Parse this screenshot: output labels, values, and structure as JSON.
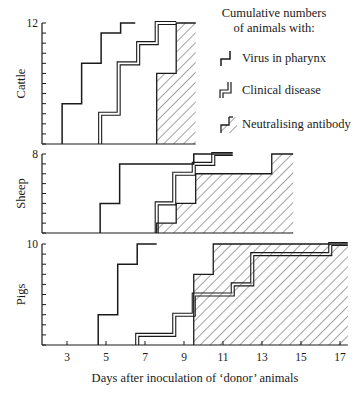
{
  "chart_data": {
    "type": "line",
    "subtype": "cumulative-step",
    "xlabel": "Days after inoculation of ‘donor’ animals",
    "x_ticks": [
      3,
      5,
      7,
      9,
      11,
      13,
      15,
      17
    ],
    "xlim": [
      1.75,
      17.4
    ],
    "legend": {
      "title_lines": [
        "Cumulative numbers",
        "of animals with:"
      ],
      "placement": "top-right",
      "entries": [
        {
          "key": "virus",
          "label": "Virus in pharynx",
          "style": "single-line"
        },
        {
          "key": "clinical",
          "label": "Clinical disease",
          "style": "double-line"
        },
        {
          "key": "antibody",
          "label": "Neutralising antibody",
          "style": "hatched"
        }
      ]
    },
    "panels": [
      {
        "name": "Cattle",
        "ylim": [
          0,
          12
        ],
        "ytick_label": "12",
        "x_end": 9.6,
        "series": {
          "virus": {
            "steps": [
              [
                2.75,
                4
              ],
              [
                3.75,
                8
              ],
              [
                4.75,
                11
              ],
              [
                5.75,
                12
              ]
            ],
            "end": 6.5
          },
          "clinical": {
            "steps": [
              [
                4.7,
                3
              ],
              [
                5.65,
                8
              ],
              [
                6.65,
                10
              ],
              [
                7.6,
                12
              ]
            ],
            "end": 8.6
          },
          "antibody": {
            "steps": [
              [
                7.6,
                7
              ],
              [
                8.6,
                12
              ]
            ],
            "end": 9.6
          }
        }
      },
      {
        "name": "Sheep",
        "ylim": [
          0,
          8
        ],
        "ytick_label": "8",
        "x_end": 14.6,
        "series": {
          "virus": {
            "steps": [
              [
                4.7,
                3
              ],
              [
                5.7,
                7
              ],
              [
                9.5,
                8
              ]
            ],
            "end": 11.5
          },
          "clinical": {
            "steps": [
              [
                7.6,
                3
              ],
              [
                8.5,
                6
              ],
              [
                9.5,
                7
              ],
              [
                10.5,
                8
              ]
            ],
            "end": 11.5
          },
          "antibody": {
            "steps": [
              [
                7.6,
                1
              ],
              [
                8.6,
                3
              ],
              [
                9.6,
                6
              ],
              [
                13.5,
                8
              ]
            ],
            "end": 14.6
          }
        }
      },
      {
        "name": "Pigs",
        "ylim": [
          0,
          10
        ],
        "ytick_label": "10",
        "x_end": 17.4,
        "series": {
          "virus": {
            "steps": [
              [
                4.6,
                3
              ],
              [
                5.6,
                8
              ],
              [
                6.6,
                10
              ]
            ],
            "end": 7.6
          },
          "clinical": {
            "steps": [
              [
                6.6,
                1
              ],
              [
                8.5,
                3
              ],
              [
                9.5,
                5
              ],
              [
                11.5,
                6
              ],
              [
                12.5,
                9
              ],
              [
                16.5,
                10
              ]
            ],
            "end": 17.4
          },
          "antibody": {
            "steps": [
              [
                9.5,
                7
              ],
              [
                10.5,
                10
              ]
            ],
            "end": 17.4
          }
        }
      }
    ]
  }
}
